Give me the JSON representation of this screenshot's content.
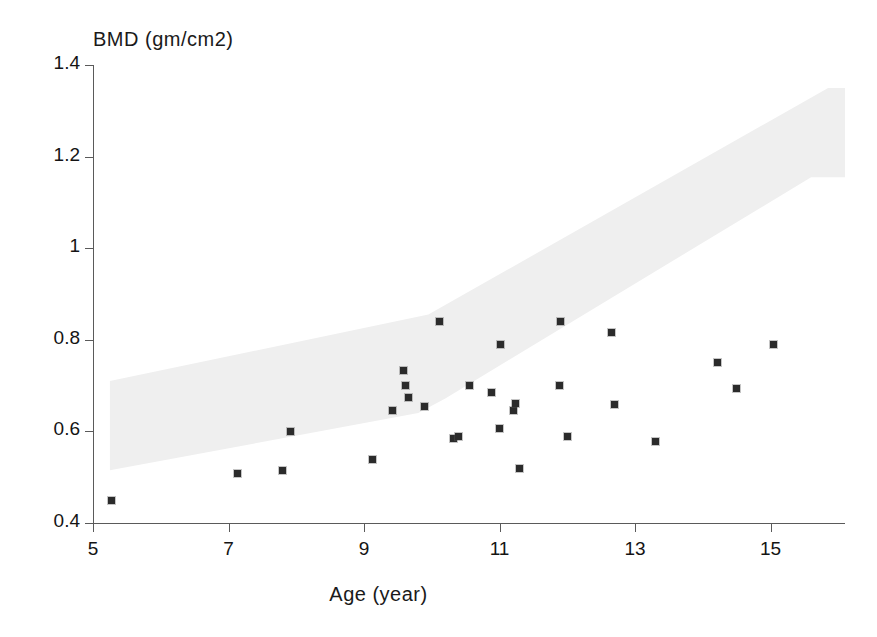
{
  "chart_data": {
    "type": "scatter",
    "title": "",
    "ylabel": "BMD (gm/cm2)",
    "xlabel": "Age (year)",
    "xlim": [
      5,
      16.1
    ],
    "ylim": [
      0.4,
      1.4
    ],
    "grid": false,
    "legend": null,
    "x_ticks": [
      "5",
      "7",
      "9",
      "11",
      "13",
      "15"
    ],
    "x_tick_values": [
      5,
      7,
      9,
      11,
      13,
      15
    ],
    "y_ticks": [
      "0.4",
      "0.6",
      "0.8",
      "1",
      "1.2",
      "1.4"
    ],
    "y_tick_values": [
      0.4,
      0.6,
      0.8,
      1.0,
      1.2,
      1.4
    ],
    "series": [
      {
        "name": "patients",
        "marker": "square",
        "color": "#2b2b2b",
        "points": [
          [
            5.27,
            0.45
          ],
          [
            7.14,
            0.508
          ],
          [
            7.79,
            0.515
          ],
          [
            7.92,
            0.6
          ],
          [
            9.13,
            0.538
          ],
          [
            9.42,
            0.645
          ],
          [
            9.58,
            0.732
          ],
          [
            9.61,
            0.7
          ],
          [
            9.66,
            0.675
          ],
          [
            9.9,
            0.655
          ],
          [
            10.11,
            0.84
          ],
          [
            10.32,
            0.585
          ],
          [
            10.4,
            0.588
          ],
          [
            10.55,
            0.7
          ],
          [
            10.88,
            0.685
          ],
          [
            11.0,
            0.607
          ],
          [
            11.01,
            0.79
          ],
          [
            11.21,
            0.645
          ],
          [
            11.23,
            0.662
          ],
          [
            11.3,
            0.518
          ],
          [
            11.88,
            0.7
          ],
          [
            11.9,
            0.84
          ],
          [
            12.0,
            0.588
          ],
          [
            12.65,
            0.815
          ],
          [
            12.7,
            0.658
          ],
          [
            13.3,
            0.578
          ],
          [
            14.22,
            0.75
          ],
          [
            14.5,
            0.693
          ],
          [
            15.05,
            0.79
          ]
        ]
      }
    ],
    "bands": [
      {
        "name": "reference-range-band",
        "color": "#efefef",
        "upper": [
          [
            5.25,
            0.71
          ],
          [
            9.95,
            0.855
          ],
          [
            15.85,
            1.35
          ],
          [
            16.1,
            1.35
          ]
        ],
        "lower": [
          [
            5.25,
            0.515
          ],
          [
            9.8,
            0.64
          ],
          [
            10.2,
            0.672
          ],
          [
            15.6,
            1.155
          ],
          [
            16.1,
            1.155
          ]
        ]
      }
    ]
  },
  "axes": {
    "y_axis_title": "BMD (gm/cm2)",
    "x_axis_title": "Age (year)"
  }
}
